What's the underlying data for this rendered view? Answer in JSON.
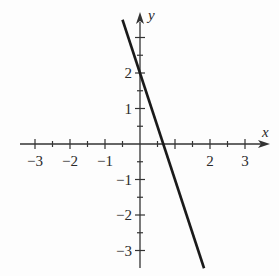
{
  "chart_data": {
    "type": "line",
    "title": "",
    "xlabel": "x",
    "ylabel": "y",
    "xlim": [
      -3.5,
      3.8
    ],
    "ylim": [
      -3.5,
      3.6
    ],
    "grid": false,
    "legend": null,
    "x_ticks": [
      -3,
      -2.5,
      -2,
      -1.5,
      -1,
      -0.5,
      0.5,
      1,
      1.5,
      2,
      2.5,
      3
    ],
    "x_tick_labels": [
      {
        "value": -3,
        "label": "−3"
      },
      {
        "value": -2,
        "label": "−2"
      },
      {
        "value": -1,
        "label": "−1"
      },
      {
        "value": 2,
        "label": "2"
      },
      {
        "value": 3,
        "label": "3"
      }
    ],
    "y_ticks": [
      -3,
      -2.5,
      -2,
      -1.5,
      -1,
      -0.5,
      0.5,
      1,
      1.5,
      2,
      2.5,
      3
    ],
    "y_tick_labels": [
      {
        "value": 2,
        "label": "2"
      },
      {
        "value": 1,
        "label": "1"
      },
      {
        "value": -1,
        "label": "−1"
      },
      {
        "value": -2,
        "label": "−2"
      },
      {
        "value": -3,
        "label": "−3"
      }
    ],
    "series": [
      {
        "name": "y = -3x + 2",
        "equation": "y = -3x + 2",
        "slope": -3,
        "intercept": 2,
        "x": [
          -0.5,
          1.83
        ],
        "y": [
          3.5,
          -3.5
        ],
        "color": "#1a1a1a"
      }
    ]
  },
  "colors": {
    "axis": "#333333",
    "line": "#1a1a1a",
    "text": "#2a2a2a",
    "background": "#fdfdfd"
  }
}
